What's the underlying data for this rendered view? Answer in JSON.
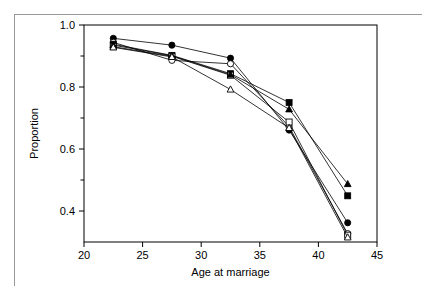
{
  "figure": {
    "name": "proportion-vs-age-at-marriage-chart"
  },
  "axis": {
    "y_label": "Proportion",
    "x_label": "Age at marriage",
    "y_ticks": [
      "1.0",
      "0.8",
      "0.6",
      "0.4"
    ],
    "x_ticks": [
      "20",
      "25",
      "30",
      "35",
      "40",
      "45"
    ]
  },
  "colors": {
    "line": "#000000",
    "marker_fill": "#000000",
    "marker_open": "#ffffff",
    "frame": "#000000",
    "border": "#9a9a9a"
  },
  "chart_data": {
    "type": "line",
    "title": "",
    "xlabel": "Age at marriage",
    "ylabel": "Proportion",
    "xlim": [
      20,
      45
    ],
    "ylim": [
      0.3,
      1.0
    ],
    "x": [
      22.5,
      27.5,
      32.5,
      37.5,
      42.5
    ],
    "xticks": [
      20,
      25,
      30,
      35,
      40,
      45
    ],
    "yticks": [
      0.4,
      0.6,
      0.8,
      1.0
    ],
    "yminorticks": [
      0.3,
      0.5,
      0.7,
      0.9
    ],
    "grid": false,
    "legend": "none",
    "series": [
      {
        "name": "filled-circle",
        "marker": "filled-circle",
        "values": [
          0.957,
          0.935,
          0.893,
          0.661,
          0.362
        ]
      },
      {
        "name": "open-circle",
        "marker": "open-circle",
        "values": [
          0.944,
          0.886,
          0.875,
          0.672,
          0.327
        ]
      },
      {
        "name": "filled-square",
        "marker": "filled-square",
        "values": [
          0.938,
          0.902,
          0.843,
          0.75,
          0.449
        ]
      },
      {
        "name": "open-square",
        "marker": "open-square",
        "values": [
          0.93,
          0.899,
          0.838,
          0.687,
          0.322
        ]
      },
      {
        "name": "filled-triangle",
        "marker": "filled-triangle",
        "values": [
          0.935,
          0.901,
          0.84,
          0.728,
          0.487
        ]
      },
      {
        "name": "open-triangle",
        "marker": "open-triangle",
        "values": [
          0.928,
          0.897,
          0.792,
          0.668,
          0.315
        ]
      }
    ]
  }
}
